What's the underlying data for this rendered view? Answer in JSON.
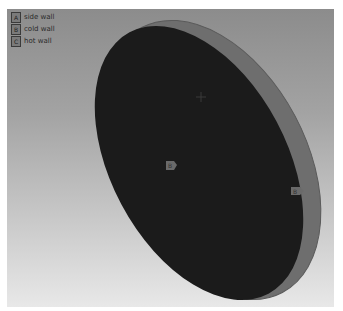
{
  "legend": {
    "items": [
      {
        "key": "A",
        "label": "side wall"
      },
      {
        "key": "B",
        "label": "cold wall"
      },
      {
        "key": "C",
        "label": "hot wall"
      }
    ]
  },
  "scene": {
    "markers": [
      {
        "key": "B",
        "position": "face-center"
      },
      {
        "key": "B",
        "position": "rim-right"
      }
    ],
    "colors": {
      "face": "#1b1b1b",
      "rim": "#6e6e6e",
      "marker": "#6a6a6a"
    }
  }
}
